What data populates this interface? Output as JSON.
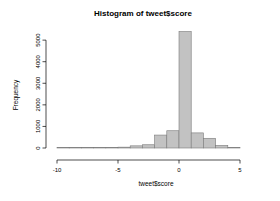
{
  "chart_data": {
    "type": "bar",
    "title": "Histogram of tweet$score",
    "xlabel": "tweet$score",
    "ylabel": "Frequency",
    "xlim": [
      -10.5,
      5.5
    ],
    "ylim": [
      0,
      5600
    ],
    "xticks": [
      -10,
      -5,
      0,
      5
    ],
    "xticklabels": [
      "-10",
      "-5",
      "0",
      "5"
    ],
    "yticks": [
      0,
      1000,
      2000,
      3000,
      4000,
      5000
    ],
    "yticklabels": [
      "0",
      "1000",
      "2000",
      "3000",
      "4000",
      "5000"
    ],
    "grid": false,
    "legend": null,
    "bin_width": 1,
    "bin_starts": [
      -10,
      -9,
      -8,
      -7,
      -6,
      -5,
      -4,
      -3,
      -2,
      -1,
      0,
      1,
      2,
      3,
      4
    ],
    "values": [
      5,
      5,
      10,
      10,
      20,
      40,
      100,
      150,
      600,
      800,
      5400,
      700,
      450,
      120,
      10
    ],
    "bar_fill": "#c2c2c2",
    "bar_stroke": "#7a7a7a"
  },
  "figure": {
    "background": "#ffffff",
    "axis_color": "#000000"
  }
}
